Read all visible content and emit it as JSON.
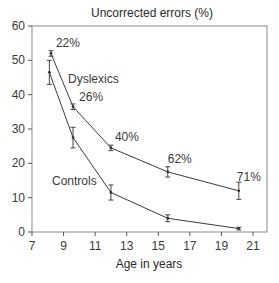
{
  "chart_data": {
    "type": "line",
    "title": "Uncorrected errors (%)",
    "xlabel": "Age in years",
    "ylabel": "",
    "xlim": [
      7,
      22
    ],
    "ylim": [
      0,
      60
    ],
    "x_ticks": [
      7,
      9,
      11,
      13,
      15,
      17,
      19,
      21
    ],
    "y_ticks": [
      0,
      10,
      20,
      30,
      40,
      50,
      60
    ],
    "grid": false,
    "legend": "inline labels",
    "series": [
      {
        "name": "Dyslexics",
        "x": [
          8.2,
          9.6,
          12.0,
          15.6,
          20.1
        ],
        "values": [
          52,
          36.5,
          24.5,
          17.5,
          12
        ],
        "error": [
          0.8,
          0.8,
          0.8,
          1.5,
          2.5
        ],
        "point_labels": [
          "22%",
          "26%",
          "40%",
          "62%",
          "71%"
        ]
      },
      {
        "name": "Controls",
        "x": [
          8.1,
          9.6,
          12.0,
          15.6,
          20.1
        ],
        "values": [
          46.5,
          27.5,
          11.5,
          4,
          1
        ],
        "error": [
          3.5,
          3,
          2.2,
          1,
          0.4
        ]
      }
    ]
  }
}
